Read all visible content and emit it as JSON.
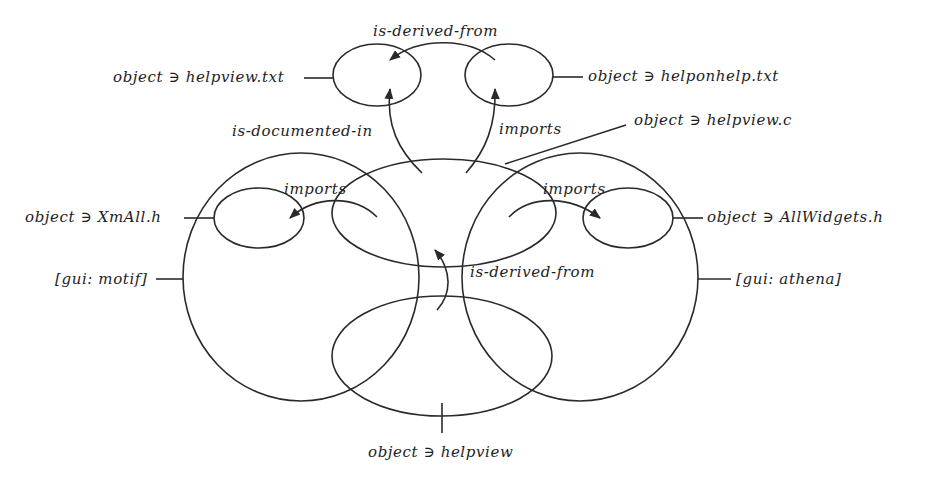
{
  "diagram": {
    "stroke_color": "#2a2a2a",
    "background": "#ffffff",
    "nodes": [
      {
        "id": "helpview_txt",
        "label": "object ∋ helpview.txt"
      },
      {
        "id": "helponhelp_txt",
        "label": "object ∋ helponhelp.txt"
      },
      {
        "id": "helpview_c",
        "label": "object ∋ helpview.c"
      },
      {
        "id": "xmall_h",
        "label": "object ∋ XmAll.h"
      },
      {
        "id": "allwidgets_h",
        "label": "object ∋ AllWidgets.h"
      },
      {
        "id": "gui_motif",
        "label": "[gui: motif]"
      },
      {
        "id": "gui_athena",
        "label": "[gui: athena]"
      },
      {
        "id": "helpview",
        "label": "object ∋ helpview"
      }
    ],
    "edges": [
      {
        "from": "helponhelp_txt",
        "to": "helpview_txt",
        "label": "is-derived-from"
      },
      {
        "from": "helpview_c",
        "to": "helpview_txt",
        "label": "is-documented-in"
      },
      {
        "from": "helpview_c",
        "to": "helponhelp_txt",
        "label": "imports"
      },
      {
        "from": "helpview_c",
        "to": "xmall_h",
        "label": "imports"
      },
      {
        "from": "helpview_c",
        "to": "allwidgets_h",
        "label": "imports"
      },
      {
        "from": "helpview",
        "to": "helpview_c",
        "label": "is-derived-from"
      }
    ]
  }
}
